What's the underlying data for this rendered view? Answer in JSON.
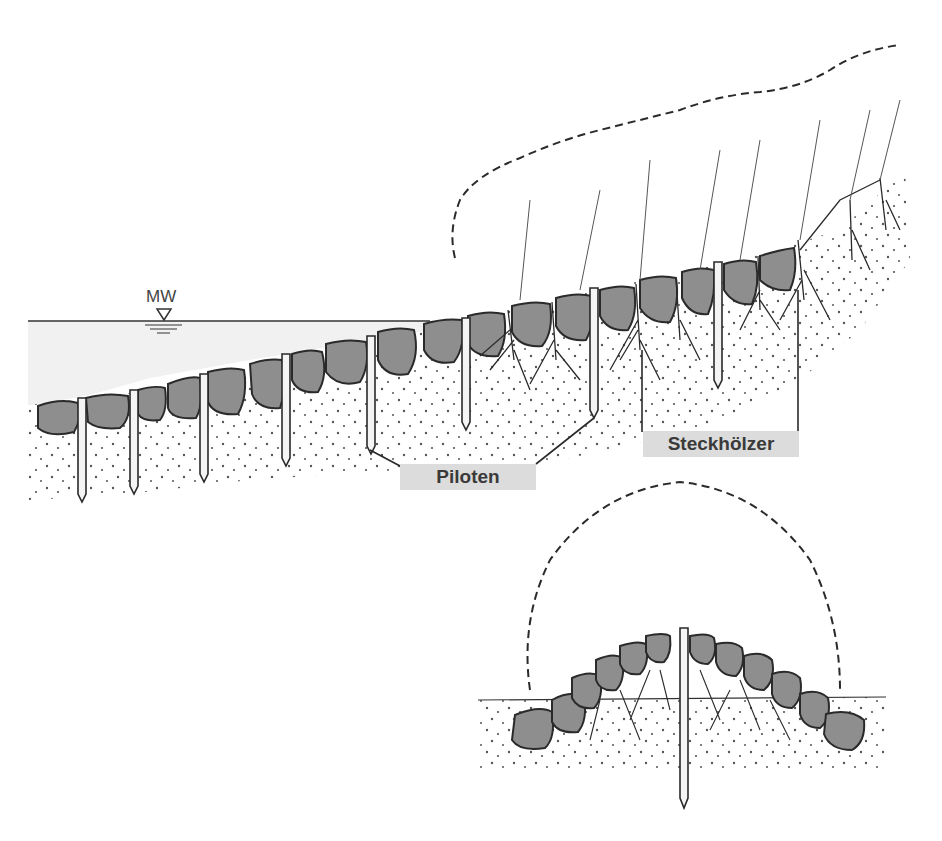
{
  "diagram": {
    "labels": {
      "water_level": "MW",
      "piles": "Piloten",
      "cuttings": "Steckhölzer"
    },
    "colors": {
      "background": "#ffffff",
      "line": "#2a2a2a",
      "stone_fill": "#8e8e8e",
      "water_fill": "#f1f1f1",
      "label_bg": "#dcdcdc",
      "label_text": "#3a3a3a",
      "soil_dots": "#555555"
    },
    "main_section": {
      "water_line_y": 321,
      "stone_count": 20,
      "pile_count": 9,
      "cutting_count": 7
    },
    "detail_section": {
      "ground_line_y": 697,
      "stone_count": 14,
      "central_pile": true
    }
  }
}
